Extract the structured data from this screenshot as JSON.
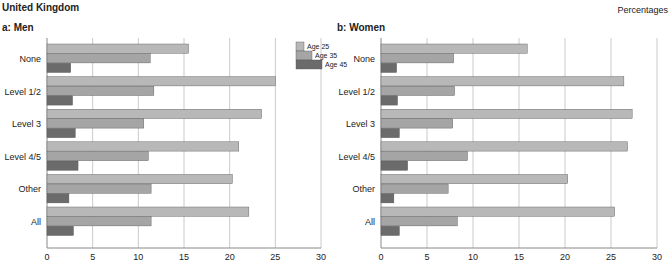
{
  "header": {
    "title": "United Kingdom",
    "units": "Percentages"
  },
  "colors": {
    "age25": "#b8b8b8",
    "age35": "#a5a5a5",
    "age45": "#6b6b6b",
    "grid": "#bdbdbd",
    "axis": "#888888"
  },
  "chart_data": [
    {
      "type": "bar",
      "orientation": "horizontal",
      "title": "a: Men",
      "xlabel": "",
      "ylabel": "",
      "xlim": [
        0,
        30
      ],
      "xticks": [
        0,
        5,
        10,
        15,
        20,
        25,
        30
      ],
      "grid": true,
      "legend": {
        "placement": "top-right",
        "entries": [
          "Age 25",
          "Age 35",
          "Age 45"
        ]
      },
      "categories": [
        "None",
        "Level 1/2",
        "Level 3",
        "Level 4/5",
        "Other",
        "All"
      ],
      "series": [
        {
          "name": "Age 25",
          "values": [
            15.5,
            25.0,
            23.5,
            21.0,
            20.3,
            22.1
          ]
        },
        {
          "name": "Age 35",
          "values": [
            11.3,
            11.7,
            10.6,
            11.1,
            11.4,
            11.4
          ]
        },
        {
          "name": "Age 45",
          "values": [
            2.6,
            2.8,
            3.1,
            3.4,
            2.4,
            2.9
          ]
        }
      ]
    },
    {
      "type": "bar",
      "orientation": "horizontal",
      "title": "b: Women",
      "xlabel": "",
      "ylabel": "",
      "xlim": [
        0,
        30
      ],
      "xticks": [
        0,
        5,
        10,
        15,
        20,
        25,
        30
      ],
      "grid": true,
      "categories": [
        "None",
        "Level 1/2",
        "Level 3",
        "Level 4/5",
        "Other",
        "All"
      ],
      "series": [
        {
          "name": "Age 25",
          "values": [
            15.9,
            26.4,
            27.3,
            26.8,
            20.3,
            25.4
          ]
        },
        {
          "name": "Age 35",
          "values": [
            7.9,
            8.0,
            7.8,
            9.4,
            7.3,
            8.3
          ]
        },
        {
          "name": "Age 45",
          "values": [
            1.7,
            1.8,
            2.0,
            2.9,
            1.4,
            2.0
          ]
        }
      ]
    }
  ]
}
